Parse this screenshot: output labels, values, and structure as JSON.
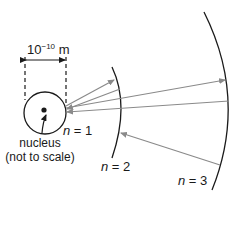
{
  "diagram": {
    "scale_label": {
      "base": "10",
      "exponent": "−10",
      "unit": " m"
    },
    "nucleus_label": "nucleus",
    "nucleus_note": "(not to scale)",
    "orbits": [
      {
        "n_symbol": "n",
        "eq": " = 1"
      },
      {
        "n_symbol": "n",
        "eq": " = 2"
      },
      {
        "n_symbol": "n",
        "eq": " = 3"
      }
    ],
    "colors": {
      "line": "#1a1a1a",
      "arrow": "#8a8a8a"
    },
    "transitions": [
      {
        "from": 1,
        "to": 2
      },
      {
        "from": 1,
        "to": 3
      },
      {
        "from": 2,
        "to": 1
      },
      {
        "from": 3,
        "to": 1
      },
      {
        "from": 3,
        "to": 2
      }
    ]
  }
}
